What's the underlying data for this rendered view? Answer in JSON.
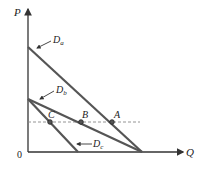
{
  "diagram": {
    "axes": {
      "y_label": "P",
      "x_label": "Q",
      "origin_label": "0"
    },
    "curves": [
      {
        "id": "Da",
        "label": "D",
        "subscript": "a"
      },
      {
        "id": "Db",
        "label": "D",
        "subscript": "b"
      },
      {
        "id": "Dc",
        "label": "D",
        "subscript": "c"
      }
    ],
    "points": [
      {
        "id": "A",
        "label": "A"
      },
      {
        "id": "B",
        "label": "B"
      },
      {
        "id": "C",
        "label": "C"
      }
    ],
    "colors": {
      "line": "#555555",
      "axis": "#333333",
      "dashed": "#888888",
      "text": "#222222"
    }
  }
}
